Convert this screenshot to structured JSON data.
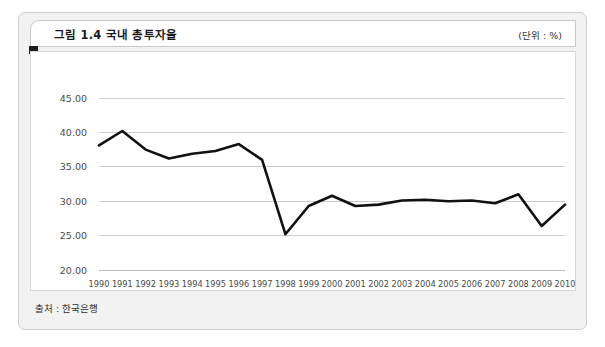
{
  "figure": {
    "title": "그림 1.4  국내 총투자율",
    "unit_label": "(단위 : %)",
    "source_note": "출처 : 한국은행"
  },
  "chart_data": {
    "type": "line",
    "title": "국내 총투자율",
    "xlabel": "",
    "ylabel": "",
    "ylim": [
      20.0,
      45.0
    ],
    "ytick_step": 5.0,
    "ytick_labels": [
      "45.00",
      "40.00",
      "35.00",
      "30.00",
      "25.00",
      "20.00"
    ],
    "ytick_values": [
      45.0,
      40.0,
      35.0,
      30.0,
      25.0,
      20.0
    ],
    "grid": true,
    "legend": "none",
    "line_color": "#111111",
    "categories": [
      "1990",
      "1991",
      "1992",
      "1993",
      "1994",
      "1995",
      "1996",
      "1997",
      "1998",
      "1999",
      "2000",
      "2001",
      "2002",
      "2003",
      "2004",
      "2005",
      "2006",
      "2007",
      "2008",
      "2009",
      "2010"
    ],
    "values": [
      38.1,
      40.2,
      37.5,
      36.2,
      36.9,
      37.3,
      38.3,
      36.0,
      25.2,
      29.3,
      30.8,
      29.3,
      29.5,
      30.1,
      30.2,
      30.0,
      30.1,
      29.7,
      31.0,
      26.4,
      29.5
    ]
  }
}
